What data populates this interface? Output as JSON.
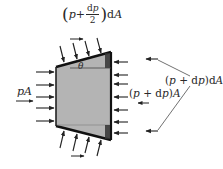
{
  "diagram": {
    "colors": {
      "background": "#ffffff",
      "element_fill": "#b4b4b4",
      "element_stroke": "#111111",
      "arrow": "#222222",
      "text": "#2a2a2a"
    },
    "element": {
      "shape": "trapezoid",
      "vertices": [
        [
          56,
          67
        ],
        [
          111,
          52
        ],
        [
          111,
          140
        ],
        [
          56,
          126
        ]
      ]
    },
    "labels": {
      "left_force": "pA",
      "right_force": "(p + dp)A",
      "right_force_parts": {
        "open": "(",
        "p": "p",
        "plus": " + d",
        "p2": "p",
        "close": ")",
        "A": "A"
      },
      "side_force": "(p + dp)dA",
      "side_force_parts": {
        "open": "(",
        "p": "p",
        "plus": " + d",
        "p2": "p",
        "close": ")d",
        "A": "A"
      },
      "top_force": "(p + dp/2)dA",
      "top_force_parts": {
        "lparen": "(",
        "p": "p",
        "plus": "+",
        "num_d": "d",
        "num_p": "p",
        "den": "2",
        "rparen": ")",
        "d": "d",
        "A": "A"
      },
      "angle": "θ"
    },
    "arrows": {
      "left_count": 5,
      "right_count": 7,
      "top_slanted_count": 4,
      "bottom_slanted_count": 4
    }
  }
}
